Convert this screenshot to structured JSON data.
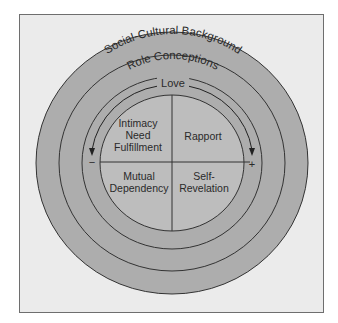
{
  "diagram": {
    "rings": {
      "outer": "Social-Cultural Background",
      "middle": "Role Conceptions",
      "inner": "Love"
    },
    "quadrants": {
      "top_left": [
        "Intimacy",
        "Need",
        "Fulfillment"
      ],
      "top_right": [
        "Rapport"
      ],
      "bottom_left": [
        "Mutual",
        "Dependency"
      ],
      "bottom_right": [
        "Self-",
        "Revelation"
      ]
    },
    "axis": {
      "negative": "−",
      "positive": "+"
    },
    "colors": {
      "background": "#ebebeb",
      "ring_fill": "#adadad",
      "core_fill": "#bdbdbd",
      "stroke": "#333333"
    }
  }
}
